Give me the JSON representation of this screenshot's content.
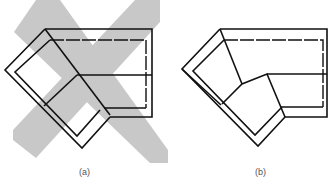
{
  "figure": {
    "panels": [
      {
        "id": "a",
        "label": "(a)",
        "description": "Corner sofa plan view overlaid with a gray X (crossed out)",
        "crossed_out": true,
        "cross_color": "#c8c8c8"
      },
      {
        "id": "b",
        "label": "(b)",
        "description": "Corner sofa plan view with angled corner seat",
        "crossed_out": false
      }
    ],
    "line_color": "#111111",
    "background": "#ffffff"
  }
}
